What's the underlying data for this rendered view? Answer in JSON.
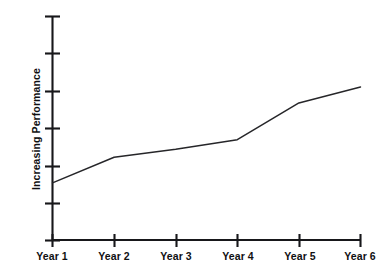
{
  "chart_data": {
    "type": "line",
    "title": "",
    "subtitle": "",
    "xlabel": "",
    "ylabel": "Increasing Performance",
    "categories": [
      "Year 1",
      "Year 2",
      "Year 3",
      "Year 4",
      "Year 5",
      "Year 6"
    ],
    "x": [
      1,
      2,
      3,
      4,
      5,
      6
    ],
    "values": [
      1.8,
      2.6,
      2.85,
      3.15,
      4.3,
      4.8
    ],
    "series": [
      {
        "name": "Performance",
        "values": [
          1.8,
          2.6,
          2.85,
          3.15,
          4.3,
          4.8
        ],
        "color": "#262629"
      }
    ],
    "ylim": [
      0,
      7
    ],
    "y_tick_count": 7,
    "y_tick_labels": [
      "",
      "",
      "",
      "",
      "",
      "",
      ""
    ],
    "grid": false,
    "legend": false,
    "legend_position": "none",
    "annotations": [],
    "axis_color": "#17171a",
    "background": "#ffffff"
  },
  "axes": {
    "y_axis": {
      "title": "Increasing Performance",
      "tick_marks": 7
    },
    "x_axis": {
      "tick_labels": [
        "Year 1",
        "Year 2",
        "Year 3",
        "Year 4",
        "Year 5",
        "Year 6"
      ]
    }
  }
}
